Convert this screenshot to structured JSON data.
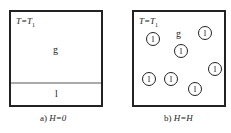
{
  "panel_a": {
    "temperature_label": "T=T",
    "temperature_sub": "1",
    "gas_label": "g",
    "liquid_label": "l",
    "caption_prefix": "a) ",
    "caption_expr": "H=0"
  },
  "panel_b": {
    "temperature_label": "T=T",
    "temperature_sub": "1",
    "gas_label": "g",
    "droplet_label": "l",
    "droplet_count": 7,
    "caption_prefix": "b) ",
    "caption_expr": "H=H"
  }
}
